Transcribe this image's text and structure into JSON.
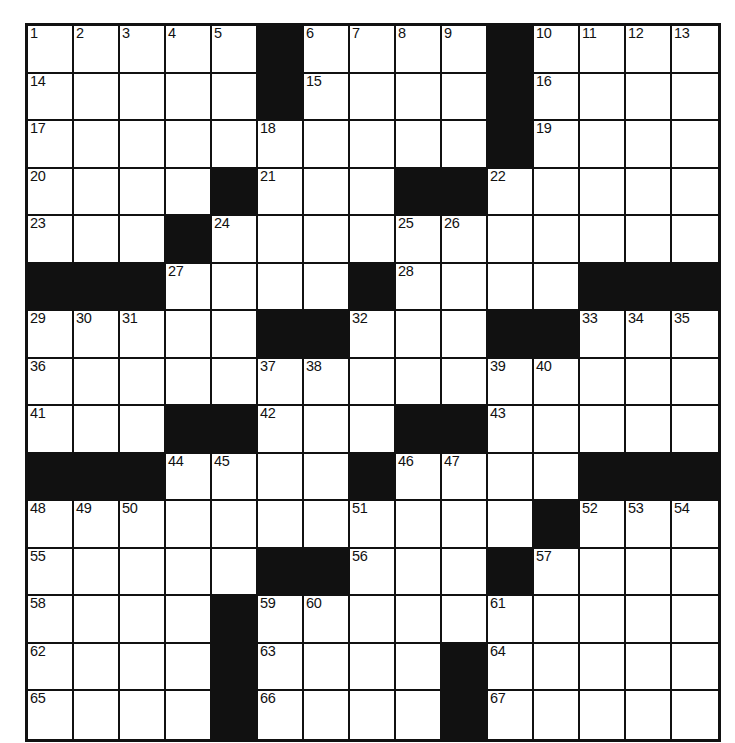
{
  "puzzle": {
    "title": "Crossword Puzzle Grid",
    "type": "crossword",
    "rows": 15,
    "cols": 15,
    "colors": {
      "block": "#111111",
      "cell": "#ffffff",
      "grid_line": "#111111",
      "number_text": "#111111",
      "page_background": "#ffffff"
    },
    "legend": {
      "block_symbol": "#",
      "open_symbol": "."
    },
    "grid_pattern": [
      ".....#....#....",
      ".....#....#....",
      "..........#....",
      "....#...##.....",
      "...#...........",
      "###....#....###",
      ".....##...##...",
      "...............",
      "...##...##.....",
      "###....#....###",
      "...........#...",
      ".....##...#....",
      "....#..........",
      "....#....#.....",
      "....#....#....."
    ],
    "numbers": [
      {
        "row": 0,
        "col": 0,
        "n": "1"
      },
      {
        "row": 0,
        "col": 1,
        "n": "2"
      },
      {
        "row": 0,
        "col": 2,
        "n": "3"
      },
      {
        "row": 0,
        "col": 3,
        "n": "4"
      },
      {
        "row": 0,
        "col": 4,
        "n": "5"
      },
      {
        "row": 0,
        "col": 6,
        "n": "6"
      },
      {
        "row": 0,
        "col": 7,
        "n": "7"
      },
      {
        "row": 0,
        "col": 8,
        "n": "8"
      },
      {
        "row": 0,
        "col": 9,
        "n": "9"
      },
      {
        "row": 0,
        "col": 11,
        "n": "10"
      },
      {
        "row": 0,
        "col": 12,
        "n": "11"
      },
      {
        "row": 0,
        "col": 13,
        "n": "12"
      },
      {
        "row": 0,
        "col": 14,
        "n": "13"
      },
      {
        "row": 1,
        "col": 0,
        "n": "14"
      },
      {
        "row": 1,
        "col": 6,
        "n": "15"
      },
      {
        "row": 1,
        "col": 11,
        "n": "16"
      },
      {
        "row": 2,
        "col": 0,
        "n": "17"
      },
      {
        "row": 2,
        "col": 5,
        "n": "18"
      },
      {
        "row": 2,
        "col": 11,
        "n": "19"
      },
      {
        "row": 3,
        "col": 0,
        "n": "20"
      },
      {
        "row": 3,
        "col": 5,
        "n": "21"
      },
      {
        "row": 3,
        "col": 10,
        "n": "22"
      },
      {
        "row": 4,
        "col": 0,
        "n": "23"
      },
      {
        "row": 4,
        "col": 4,
        "n": "24"
      },
      {
        "row": 4,
        "col": 8,
        "n": "25"
      },
      {
        "row": 4,
        "col": 9,
        "n": "26"
      },
      {
        "row": 5,
        "col": 3,
        "n": "27"
      },
      {
        "row": 5,
        "col": 8,
        "n": "28"
      },
      {
        "row": 6,
        "col": 0,
        "n": "29"
      },
      {
        "row": 6,
        "col": 1,
        "n": "30"
      },
      {
        "row": 6,
        "col": 2,
        "n": "31"
      },
      {
        "row": 6,
        "col": 7,
        "n": "32"
      },
      {
        "row": 6,
        "col": 12,
        "n": "33"
      },
      {
        "row": 6,
        "col": 13,
        "n": "34"
      },
      {
        "row": 6,
        "col": 14,
        "n": "35"
      },
      {
        "row": 7,
        "col": 0,
        "n": "36"
      },
      {
        "row": 7,
        "col": 5,
        "n": "37"
      },
      {
        "row": 7,
        "col": 6,
        "n": "38"
      },
      {
        "row": 7,
        "col": 10,
        "n": "39"
      },
      {
        "row": 7,
        "col": 11,
        "n": "40"
      },
      {
        "row": 8,
        "col": 0,
        "n": "41"
      },
      {
        "row": 8,
        "col": 5,
        "n": "42"
      },
      {
        "row": 8,
        "col": 10,
        "n": "43"
      },
      {
        "row": 9,
        "col": 3,
        "n": "44"
      },
      {
        "row": 9,
        "col": 4,
        "n": "45"
      },
      {
        "row": 9,
        "col": 8,
        "n": "46"
      },
      {
        "row": 9,
        "col": 9,
        "n": "47"
      },
      {
        "row": 10,
        "col": 0,
        "n": "48"
      },
      {
        "row": 10,
        "col": 1,
        "n": "49"
      },
      {
        "row": 10,
        "col": 2,
        "n": "50"
      },
      {
        "row": 10,
        "col": 7,
        "n": "51"
      },
      {
        "row": 10,
        "col": 12,
        "n": "52"
      },
      {
        "row": 10,
        "col": 13,
        "n": "53"
      },
      {
        "row": 10,
        "col": 14,
        "n": "54"
      },
      {
        "row": 11,
        "col": 0,
        "n": "55"
      },
      {
        "row": 11,
        "col": 7,
        "n": "56"
      },
      {
        "row": 11,
        "col": 11,
        "n": "57"
      },
      {
        "row": 12,
        "col": 0,
        "n": "58"
      },
      {
        "row": 12,
        "col": 5,
        "n": "59"
      },
      {
        "row": 12,
        "col": 6,
        "n": "60"
      },
      {
        "row": 12,
        "col": 10,
        "n": "61"
      },
      {
        "row": 13,
        "col": 0,
        "n": "62"
      },
      {
        "row": 13,
        "col": 5,
        "n": "63"
      },
      {
        "row": 13,
        "col": 10,
        "n": "64"
      },
      {
        "row": 14,
        "col": 0,
        "n": "65"
      },
      {
        "row": 14,
        "col": 5,
        "n": "66"
      },
      {
        "row": 14,
        "col": 10,
        "n": "67"
      }
    ],
    "entries": []
  }
}
